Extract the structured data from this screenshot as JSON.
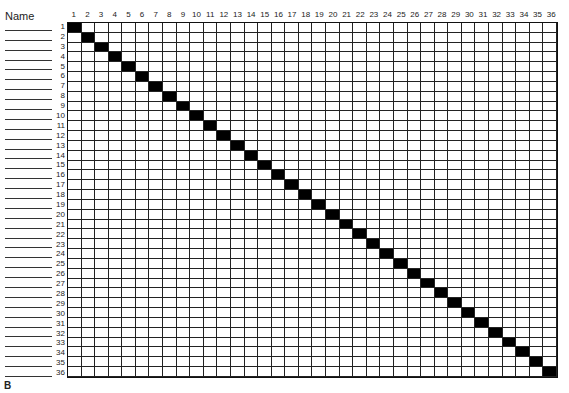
{
  "header": {
    "name_label": "Name"
  },
  "figure_label": "B",
  "grid": {
    "size": 36,
    "column_labels": [
      "1",
      "2",
      "3",
      "4",
      "5",
      "6",
      "7",
      "8",
      "9",
      "10",
      "11",
      "12",
      "13",
      "14",
      "15",
      "16",
      "17",
      "18",
      "19",
      "20",
      "21",
      "22",
      "23",
      "24",
      "25",
      "26",
      "27",
      "28",
      "29",
      "30",
      "31",
      "32",
      "33",
      "34",
      "35",
      "36"
    ],
    "row_labels": [
      "1",
      "2",
      "3",
      "4",
      "5",
      "6",
      "7",
      "8",
      "9",
      "10",
      "11",
      "12",
      "13",
      "14",
      "15",
      "16",
      "17",
      "18",
      "19",
      "20",
      "21",
      "22",
      "23",
      "24",
      "25",
      "26",
      "27",
      "28",
      "29",
      "30",
      "31",
      "32",
      "33",
      "34",
      "35",
      "36"
    ],
    "filled_color": "#000000",
    "diagonal_filled": true
  }
}
